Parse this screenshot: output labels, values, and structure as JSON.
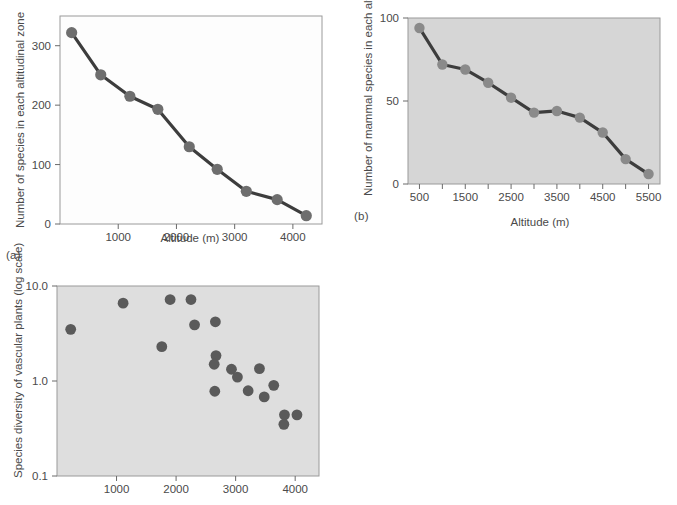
{
  "figure": {
    "background_color": "#ffffff",
    "marker_color_a": "#6e6e6e",
    "marker_color_b": "#8a8a8a",
    "marker_color_c": "#5a5a5a",
    "line_color": "#3d3d3d",
    "panel_bg_a": "#fdfdfd",
    "panel_bg_b": "#d6d6d6",
    "panel_bg_c": "#dedede",
    "frame_color": "#9a9a9a"
  },
  "panels": {
    "a": {
      "label": "(a)"
    },
    "b": {
      "label": "(b)"
    },
    "c": {
      "label": ""
    }
  },
  "chart_data": [
    {
      "id": "a",
      "type": "line",
      "title": "",
      "panel_label": "(a)",
      "xlabel": "Altitude (m)",
      "ylabel": "Number of species in each altitudinal zone",
      "xlim": [
        0,
        4500
      ],
      "ylim": [
        0,
        350
      ],
      "xticks": [
        1000,
        2000,
        3000,
        4000
      ],
      "xticklabels": [
        "1000",
        "2000",
        "3000",
        "4000"
      ],
      "yticks": [
        0,
        100,
        200,
        300
      ],
      "yticklabels": [
        "0",
        "100",
        "200",
        "300"
      ],
      "grid": false,
      "legend": "none",
      "x": [
        200,
        700,
        1200,
        1680,
        2220,
        2700,
        3200,
        3730,
        4230
      ],
      "values": [
        322,
        251,
        215,
        193,
        130,
        92,
        55,
        41,
        14
      ]
    },
    {
      "id": "b",
      "type": "line",
      "title": "",
      "panel_label": "(b)",
      "xlabel": "Altitude (m)",
      "ylabel": "Number of mammal species in each altitudinal zone",
      "xlim": [
        250,
        5750
      ],
      "ylim": [
        0,
        100
      ],
      "xticks": [
        500,
        1000,
        1500,
        2000,
        2500,
        3000,
        3500,
        4000,
        4500,
        5000,
        5500
      ],
      "xticklabels": [
        "500",
        "",
        "1500",
        "",
        "2500",
        "",
        "3500",
        "",
        "4500",
        "",
        "5500"
      ],
      "yticks": [
        0,
        50,
        100
      ],
      "yticklabels": [
        "0",
        "50",
        "100"
      ],
      "grid": false,
      "legend": "none",
      "x": [
        500,
        1000,
        1500,
        2000,
        2500,
        3000,
        3500,
        4000,
        4500,
        5000,
        5500
      ],
      "values": [
        94,
        72,
        69,
        61,
        52,
        43,
        44,
        40,
        31,
        15,
        6
      ]
    },
    {
      "id": "c",
      "type": "scatter",
      "title": "",
      "panel_label": "",
      "xlabel": "",
      "ylabel": "Species diversity of vascular plants (log scale)",
      "xlim": [
        0,
        4400
      ],
      "ylim": [
        0.1,
        10.0
      ],
      "yscale": "log",
      "xticks": [
        1000,
        2000,
        3000,
        4000
      ],
      "xticklabels": [
        "1000",
        "2000",
        "3000",
        "4000"
      ],
      "yticks": [
        0.1,
        1.0,
        10.0
      ],
      "yticklabels": [
        "0.1",
        "1.0",
        "10.0"
      ],
      "grid": false,
      "legend": "none",
      "points": [
        {
          "x": 230,
          "y": 3.5
        },
        {
          "x": 1110,
          "y": 6.6
        },
        {
          "x": 1760,
          "y": 2.3
        },
        {
          "x": 1900,
          "y": 7.2
        },
        {
          "x": 2250,
          "y": 7.2
        },
        {
          "x": 2310,
          "y": 3.9
        },
        {
          "x": 2660,
          "y": 4.2
        },
        {
          "x": 2670,
          "y": 1.85
        },
        {
          "x": 2640,
          "y": 1.5
        },
        {
          "x": 2650,
          "y": 0.78
        },
        {
          "x": 2930,
          "y": 1.33
        },
        {
          "x": 3030,
          "y": 1.1
        },
        {
          "x": 3210,
          "y": 0.79
        },
        {
          "x": 3400,
          "y": 1.35
        },
        {
          "x": 3480,
          "y": 0.68
        },
        {
          "x": 3640,
          "y": 0.9
        },
        {
          "x": 3820,
          "y": 0.44
        },
        {
          "x": 3810,
          "y": 0.35
        },
        {
          "x": 4030,
          "y": 0.44
        }
      ]
    }
  ]
}
